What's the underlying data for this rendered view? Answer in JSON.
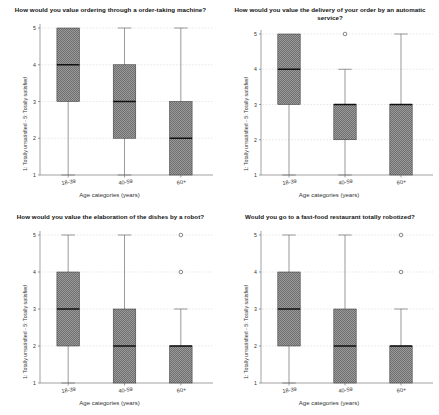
{
  "figure": {
    "background": "#ffffff",
    "box_fill": "#8c8c8c",
    "box_edge": "#3a3a3a",
    "median_color": "#111111",
    "whisker_color": "#6e6e6e",
    "grid_color": "#d9d9d9",
    "axis_color": "#7a7a7a"
  },
  "common": {
    "ylabel": "1: Totally unsatisfied - 5: Totally satisfied",
    "xlabel": "Age categories (years)",
    "categories": [
      "18-39",
      "40-59",
      "60+"
    ],
    "yticks": [
      "1",
      "2",
      "3",
      "4",
      "5"
    ],
    "ylim": [
      1,
      5
    ]
  },
  "chart_data": [
    {
      "type": "box",
      "panel": 1,
      "title": "How would you value ordering through a order-taking machine?",
      "xlabel": "Age categories (years)",
      "ylabel": "1: Totally unsatisfied - 5: Totally satisfied",
      "categories": [
        "18-39",
        "40-59",
        "60+"
      ],
      "ylim": [
        1,
        5
      ],
      "yticks": [
        1,
        2,
        3,
        4,
        5
      ],
      "grid": true,
      "boxes": [
        {
          "category": "18-39",
          "whisker_low": 1,
          "q1": 3,
          "median": 4,
          "q3": 5,
          "whisker_high": 5,
          "outliers": []
        },
        {
          "category": "40-59",
          "whisker_low": 1,
          "q1": 2,
          "median": 3,
          "q3": 4,
          "whisker_high": 5,
          "outliers": []
        },
        {
          "category": "60+",
          "whisker_low": 1,
          "q1": 1,
          "median": 2,
          "q3": 3,
          "whisker_high": 5,
          "outliers": []
        }
      ]
    },
    {
      "type": "box",
      "panel": 2,
      "title": "How would you value the delivery of your order by an automatic service?",
      "xlabel": "Age categories (years)",
      "ylabel": "1: Totally unsatisfied - 5: Totally satisfied",
      "categories": [
        "18-39",
        "40-59",
        "60+"
      ],
      "ylim": [
        1,
        5
      ],
      "yticks": [
        1,
        2,
        3,
        4,
        5
      ],
      "grid": true,
      "boxes": [
        {
          "category": "18-39",
          "whisker_low": 1,
          "q1": 3,
          "median": 4,
          "q3": 5,
          "whisker_high": 5,
          "outliers": []
        },
        {
          "category": "40-59",
          "whisker_low": 1,
          "q1": 2,
          "median": 3,
          "q3": 3,
          "whisker_high": 4,
          "outliers": [
            5
          ]
        },
        {
          "category": "60+",
          "whisker_low": 1,
          "q1": 1,
          "median": 3,
          "q3": 3,
          "whisker_high": 5,
          "outliers": []
        }
      ]
    },
    {
      "type": "box",
      "panel": 3,
      "title": "How would you value the elaboration of the dishes by a robot?",
      "xlabel": "Age categories (years)",
      "ylabel": "1: Totally unsatisfied - 5: Totally satisfied",
      "categories": [
        "18-39",
        "40-59",
        "60+"
      ],
      "ylim": [
        1,
        5
      ],
      "yticks": [
        1,
        2,
        3,
        4,
        5
      ],
      "grid": true,
      "boxes": [
        {
          "category": "18-39",
          "whisker_low": 1,
          "q1": 2,
          "median": 3,
          "q3": 4,
          "whisker_high": 5,
          "outliers": []
        },
        {
          "category": "40-59",
          "whisker_low": 1,
          "q1": 1,
          "median": 2,
          "q3": 3,
          "whisker_high": 5,
          "outliers": []
        },
        {
          "category": "60+",
          "whisker_low": 1,
          "q1": 1,
          "median": 2,
          "q3": 2,
          "whisker_high": 3,
          "outliers": [
            4,
            5
          ]
        }
      ]
    },
    {
      "type": "box",
      "panel": 4,
      "title": "Would you go to a fast-food restaurant totally robotized?",
      "xlabel": "Age categories (years)",
      "ylabel": "1: Totally unsatisfied - 5: Totally satisfied",
      "categories": [
        "18-39",
        "40-59",
        "60+"
      ],
      "ylim": [
        1,
        5
      ],
      "yticks": [
        1,
        2,
        3,
        4,
        5
      ],
      "grid": true,
      "boxes": [
        {
          "category": "18-39",
          "whisker_low": 1,
          "q1": 2,
          "median": 3,
          "q3": 4,
          "whisker_high": 5,
          "outliers": []
        },
        {
          "category": "40-59",
          "whisker_low": 1,
          "q1": 1,
          "median": 2,
          "q3": 3,
          "whisker_high": 5,
          "outliers": []
        },
        {
          "category": "60+",
          "whisker_low": 1,
          "q1": 1,
          "median": 2,
          "q3": 2,
          "whisker_high": 3,
          "outliers": [
            4,
            5
          ]
        }
      ]
    }
  ]
}
